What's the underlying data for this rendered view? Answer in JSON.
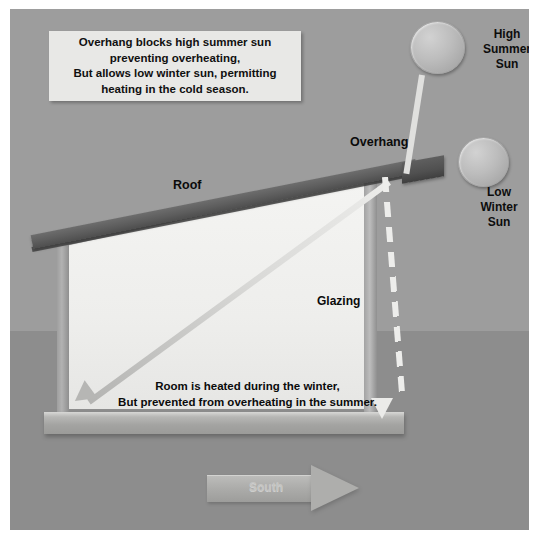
{
  "diagram": {
    "caption": {
      "lines": [
        "Overhang blocks high summer sun",
        "preventing overheating,",
        "But allows low winter sun, permitting",
        "heating in the cold season."
      ]
    },
    "sun_labels": {
      "summer": "High\nSummer\nSun",
      "summer_line1": "High",
      "summer_line2": "Summer",
      "summer_line3": "Sun",
      "winter_line1": "Low",
      "winter_line2": "Winter",
      "winter_line3": "Sun"
    },
    "structure_labels": {
      "roof": "Roof",
      "overhang": "Overhang",
      "glazing": "Glazing"
    },
    "room_text": {
      "line1": "Room is heated during the winter,",
      "line2": "But prevented from  overheating in the summer."
    },
    "direction": {
      "south": "South"
    },
    "colors": {
      "sky": "#9d9d9d",
      "ground": "#8d8d8d",
      "roof_beam": "#5d5d5d",
      "glazing": "#f0f0ee",
      "caption_box": "#e8e8e6",
      "sun_disc": "#bdbdbd",
      "text": "#0b0b0b"
    },
    "icons": {
      "summer_ray": "dashed-downward-arrow",
      "winter_ray": "solid-diagonal-arrow",
      "south": "right-arrow"
    }
  }
}
